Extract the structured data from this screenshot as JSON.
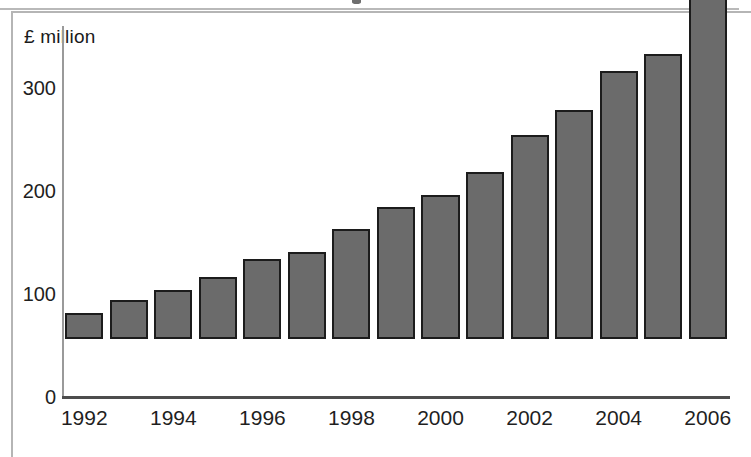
{
  "figure": {
    "unit_label": "£ million",
    "frame_color": "#b5b5b5",
    "bar_fill_color": "#6b6b6b",
    "bar_edge_color": "#1c1c1c",
    "axis_color": "#4d4d4d",
    "background_color": "#ffffff"
  },
  "chart_data": {
    "type": "bar",
    "title": "",
    "subtitle": "",
    "xlabel": "",
    "ylabel": "£ million",
    "categories": [
      "1992",
      "1993",
      "1994",
      "1995",
      "1996",
      "1997",
      "1998",
      "1999",
      "2000",
      "2001",
      "2002",
      "2003",
      "2004",
      "2005",
      "2006"
    ],
    "values": [
      25,
      38,
      48,
      60,
      78,
      84,
      107,
      128,
      140,
      162,
      198,
      222,
      260,
      277,
      344
    ],
    "x_tick_labels": [
      "1992",
      "1994",
      "1996",
      "1998",
      "2000",
      "2002",
      "2004",
      "2006"
    ],
    "x_tick_indices": [
      0,
      2,
      4,
      6,
      8,
      10,
      12,
      14
    ],
    "y_tick_labels": [
      "0",
      "100",
      "200",
      "300"
    ],
    "y_tick_values": [
      0,
      100,
      200,
      300
    ],
    "ylim": [
      0,
      360
    ],
    "grid": false,
    "legend": false,
    "legend_position": "none",
    "series": [
      {
        "name": "£ million",
        "values": [
          25,
          38,
          48,
          60,
          78,
          84,
          107,
          128,
          140,
          162,
          198,
          222,
          260,
          277,
          344
        ]
      }
    ]
  }
}
